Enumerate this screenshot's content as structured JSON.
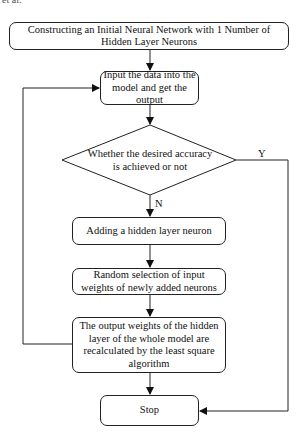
{
  "caption": "et al.",
  "flowchart": {
    "nodes": [
      {
        "id": "init",
        "shape": "rounded-rect",
        "text": "Constructing an Initial Neural Network with 1 Number of Hidden Layer Neurons"
      },
      {
        "id": "input",
        "shape": "rounded-rect",
        "text": "Input the data into the model and get the output"
      },
      {
        "id": "decision",
        "shape": "diamond",
        "text": "Whether the desired accuracy is achieved or not"
      },
      {
        "id": "add",
        "shape": "rounded-rect",
        "text": "Adding a hidden layer neuron"
      },
      {
        "id": "random",
        "shape": "rounded-rect",
        "text": "Random selection of input weights of newly added neurons"
      },
      {
        "id": "recalc",
        "shape": "rounded-rect",
        "text": "The output weights of the hidden layer of the whole model are recalculated by the least square algorithm"
      },
      {
        "id": "stop",
        "shape": "rounded-rect",
        "text": "Stop"
      }
    ],
    "edges": [
      {
        "from": "init",
        "to": "input",
        "label": ""
      },
      {
        "from": "input",
        "to": "decision",
        "label": ""
      },
      {
        "from": "decision",
        "to": "add",
        "label": "N"
      },
      {
        "from": "decision",
        "to": "stop",
        "label": "Y"
      },
      {
        "from": "add",
        "to": "random",
        "label": ""
      },
      {
        "from": "random",
        "to": "recalc",
        "label": ""
      },
      {
        "from": "recalc",
        "to": "stop",
        "label": ""
      },
      {
        "from": "recalc",
        "to": "input",
        "label": ""
      }
    ],
    "labels": {
      "yes": "Y",
      "no": "N"
    }
  }
}
